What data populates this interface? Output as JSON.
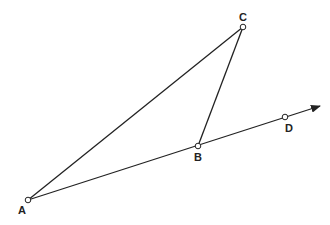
{
  "diagram": {
    "caption_partial": "",
    "points": [
      {
        "id": "A",
        "label": "A",
        "x": 28,
        "y": 200,
        "lx": 22,
        "ly": 214
      },
      {
        "id": "B",
        "label": "B",
        "x": 198,
        "y": 146,
        "lx": 198,
        "ly": 161
      },
      {
        "id": "C",
        "label": "C",
        "x": 243,
        "y": 27,
        "lx": 243,
        "ly": 21
      },
      {
        "id": "D",
        "label": "D",
        "x": 285,
        "y": 117,
        "lx": 289,
        "ly": 132
      }
    ],
    "segments": [
      {
        "from": "A",
        "to": "C"
      },
      {
        "from": "C",
        "to": "B"
      }
    ],
    "ray": {
      "from": "A",
      "through": [
        "B",
        "D"
      ],
      "tip": {
        "x": 320,
        "y": 106
      }
    },
    "colors": {
      "stroke": "#222222",
      "point_fill": "#ffffff",
      "background": "#ffffff"
    }
  }
}
